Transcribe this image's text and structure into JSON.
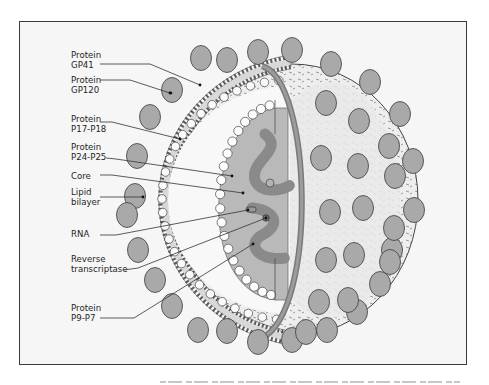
{
  "figure": {
    "colors": {
      "frame_bg": "#f6f6f6",
      "frame_border": "#3a3a3a",
      "spike_fill": "#a9a9a9",
      "core_fill": "#b8b8b8",
      "interior_fill": "#f7f7f7",
      "shell_fill": "#e2e2e2",
      "outline": "#3c3c3c"
    },
    "labels": [
      {
        "id": "gp41",
        "line1": "Protein",
        "line2": "GP41",
        "x": 71,
        "y": 58,
        "lead": [
          [
            100,
            64
          ],
          [
            150,
            64
          ],
          [
            200,
            85
          ]
        ]
      },
      {
        "id": "gp120",
        "line1": "Protein",
        "line2": "GP120",
        "x": 71,
        "y": 83,
        "lead": [
          [
            100,
            80
          ],
          [
            130,
            80
          ],
          [
            170,
            93
          ]
        ]
      },
      {
        "id": "p17",
        "line1": "Protein",
        "line2": "P17-P18",
        "x": 71,
        "y": 122,
        "lead": [
          [
            100,
            122
          ],
          [
            112,
            122
          ],
          [
            180,
            139
          ]
        ]
      },
      {
        "id": "p24",
        "line1": "Protein",
        "line2": "P24-P25",
        "x": 71,
        "y": 150,
        "lead": [
          [
            106,
            158
          ],
          [
            116,
            159
          ],
          [
            232,
            176
          ]
        ]
      },
      {
        "id": "core",
        "line1": "Core",
        "line2": "",
        "x": 71,
        "y": 179,
        "lead": [
          [
            100,
            175
          ],
          [
            112,
            175
          ],
          [
            243,
            193
          ]
        ]
      },
      {
        "id": "lipid",
        "line1": "Lipid",
        "line2": "bilayer",
        "x": 71,
        "y": 195,
        "lead": [
          [
            100,
            197
          ],
          [
            124,
            197
          ],
          [
            143,
            197
          ]
        ]
      },
      {
        "id": "rna",
        "line1": "RNA",
        "line2": "",
        "x": 71,
        "y": 237,
        "lead": [
          [
            100,
            235
          ],
          [
            116,
            235
          ],
          [
            248,
            210
          ]
        ]
      },
      {
        "id": "rt",
        "line1": "Reverse",
        "line2": "transcriptase",
        "x": 71,
        "y": 262,
        "lead": [
          [
            124,
            270
          ],
          [
            138,
            268
          ],
          [
            266,
            218
          ]
        ]
      },
      {
        "id": "p9",
        "line1": "Protein",
        "line2": "P9-P7",
        "x": 71,
        "y": 311,
        "lead": [
          [
            100,
            318
          ],
          [
            134,
            318
          ],
          [
            253,
            244
          ]
        ]
      }
    ]
  }
}
